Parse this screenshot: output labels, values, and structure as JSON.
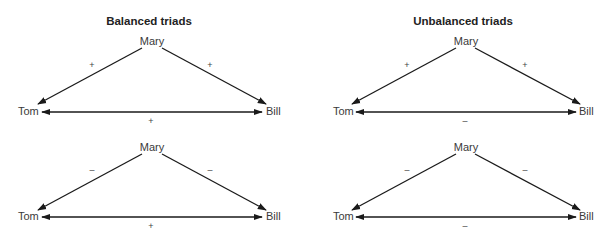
{
  "panels": [
    {
      "title": "Balanced triads",
      "triads": [
        {
          "top": "Mary",
          "left": "Tom",
          "right": "Bill",
          "sign_mary_tom": "+",
          "sign_mary_bill": "+",
          "sign_tom_bill": "+"
        },
        {
          "top": "Mary",
          "left": "Tom",
          "right": "Bill",
          "sign_mary_tom": "–",
          "sign_mary_bill": "–",
          "sign_tom_bill": "+"
        }
      ]
    },
    {
      "title": "Unbalanced triads",
      "triads": [
        {
          "top": "Mary",
          "left": "Tom",
          "right": "Bill",
          "sign_mary_tom": "+",
          "sign_mary_bill": "+",
          "sign_tom_bill": "–"
        },
        {
          "top": "Mary",
          "left": "Tom",
          "right": "Bill",
          "sign_mary_tom": "–",
          "sign_mary_bill": "–",
          "sign_tom_bill": "–"
        }
      ]
    }
  ],
  "colors": {
    "line": "#1a1a1a",
    "text": "#3a3a3a"
  }
}
